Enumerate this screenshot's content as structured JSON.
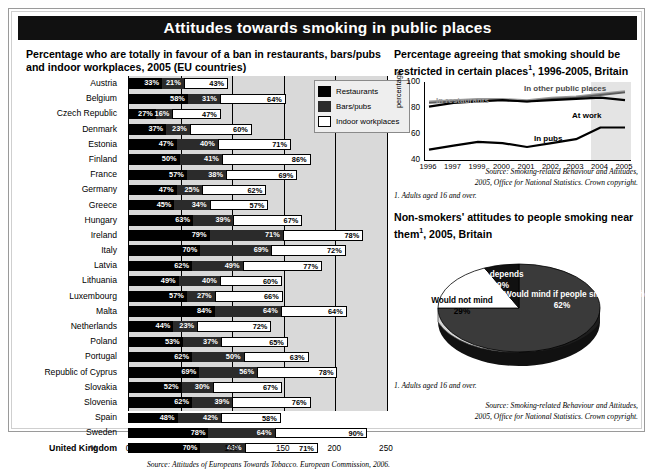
{
  "header": {
    "title": "Attitudes towards smoking in public places"
  },
  "left_panel": {
    "title": "Percentage who are totally in favour of a ban in restaurants, bars/pubs and indoor workplaces, 2005 (EU countries)",
    "axis_unit": "%",
    "source": "Source: Attitudes of Europeans Towards Tobacco. European Commission, 2006.",
    "legend": [
      {
        "label": "Restaurants",
        "color": "#000000"
      },
      {
        "label": "Bars/pubs",
        "color": "#2b2b2b"
      },
      {
        "label": "Indoor workplaces",
        "color": "#ffffff"
      }
    ]
  },
  "line_panel": {
    "title": "Percentage agreeing that smoking should be restricted in certain places",
    "title_sup": "1",
    "title_tail": ", 1996-2005, Britain",
    "note": "1. Adults aged 16 and over.",
    "source_line1": "Source: Smoking-related Behaviour and Attitudes,",
    "source_line2": "2005, Office for National Statistics. Crown copyright."
  },
  "pie_panel": {
    "title": "Non-smokers' attitudes to people smoking near them",
    "title_sup": "1",
    "title_tail": ", 2005, Britain",
    "note": "1. Adults aged 16 and over.",
    "source_line1": "Source: Smoking-related Behaviour and Attitudes,",
    "source_line2": "2005, Office for National Statistics. Crown copyright."
  },
  "chart_data": [
    {
      "type": "bar",
      "orientation": "horizontal",
      "stacked": true,
      "title": "Percentage who are totally in favour of a ban in restaurants, bars/pubs and indoor workplaces, 2005 (EU countries)",
      "xlabel": "%",
      "ylabel": "",
      "xlim": [
        0,
        250
      ],
      "xticks": [
        0,
        50,
        100,
        150,
        200,
        250
      ],
      "grid": true,
      "legend_position": "right",
      "categories": [
        "Austria",
        "Belgium",
        "Czech Republic",
        "Denmark",
        "Estonia",
        "Finland",
        "France",
        "Germany",
        "Greece",
        "Hungary",
        "Ireland",
        "Italy",
        "Latvia",
        "Lithuania",
        "Luxembourg",
        "Malta",
        "Netherlands",
        "Poland",
        "Portugal",
        "Republic of Cyprus",
        "Slovakia",
        "Slovenia",
        "Spain",
        "Sweden",
        "United Kingdom"
      ],
      "series": [
        {
          "name": "Restaurants",
          "color": "#000000",
          "values": [
            33,
            58,
            27,
            37,
            47,
            50,
            57,
            47,
            45,
            63,
            79,
            70,
            62,
            49,
            57,
            84,
            44,
            53,
            62,
            69,
            52,
            62,
            48,
            78,
            70
          ]
        },
        {
          "name": "Bars/pubs",
          "color": "#2b2b2b",
          "values": [
            21,
            31,
            16,
            23,
            40,
            41,
            38,
            25,
            34,
            39,
            71,
            69,
            49,
            40,
            27,
            64,
            23,
            37,
            50,
            56,
            30,
            39,
            42,
            64,
            43
          ]
        },
        {
          "name": "Indoor workplaces",
          "color": "#ffffff",
          "values": [
            43,
            64,
            47,
            60,
            71,
            86,
            69,
            62,
            57,
            67,
            78,
            72,
            77,
            60,
            66,
            64,
            72,
            65,
            63,
            78,
            67,
            76,
            58,
            90,
            71
          ]
        }
      ]
    },
    {
      "type": "line",
      "title": "Percentage agreeing that smoking should be restricted in certain places, 1996-2005, Britain",
      "xlabel": "",
      "ylabel": "percentage",
      "ylim": [
        40,
        100
      ],
      "yticks": [
        40,
        60,
        80,
        100
      ],
      "x": [
        "1996",
        "1997",
        "1999",
        "2000",
        "2001",
        "2002",
        "2003",
        "2004",
        "2005"
      ],
      "grid": false,
      "legend_position": "inline-annotations",
      "series": [
        {
          "name": "In restaurants",
          "color": "#9a9a9a",
          "values": [
            85,
            86,
            87,
            87,
            86,
            88,
            89,
            91,
            93
          ]
        },
        {
          "name": "In other public places",
          "color": "#5a5a5a",
          "values": [
            84,
            85,
            86,
            86,
            85,
            87,
            88,
            90,
            92
          ]
        },
        {
          "name": "At work",
          "color": "#000000",
          "values": [
            81,
            84,
            85,
            86,
            85,
            86,
            87,
            88,
            86
          ]
        },
        {
          "name": "In pubs",
          "color": "#000000",
          "values": [
            48,
            51,
            54,
            53,
            50,
            53,
            56,
            65,
            65
          ]
        }
      ],
      "annotations": [
        {
          "text": "In restaurants",
          "color": "#9a9a9a"
        },
        {
          "text": "In other public places",
          "color": "#4a4a4a"
        },
        {
          "text": "At work",
          "color": "#000000"
        },
        {
          "text": "In pubs",
          "color": "#000000"
        }
      ]
    },
    {
      "type": "pie",
      "title": "Non-smokers' attitudes to people smoking near them, 2005, Britain",
      "labels": [
        "Would mind if people smoke near them",
        "Would not mind",
        "It depends"
      ],
      "values": [
        62,
        29,
        9
      ],
      "value_labels": [
        "62%",
        "29%",
        "9%"
      ],
      "colors": [
        "#3a3a3a",
        "#ffffff",
        "#111111"
      ]
    }
  ]
}
